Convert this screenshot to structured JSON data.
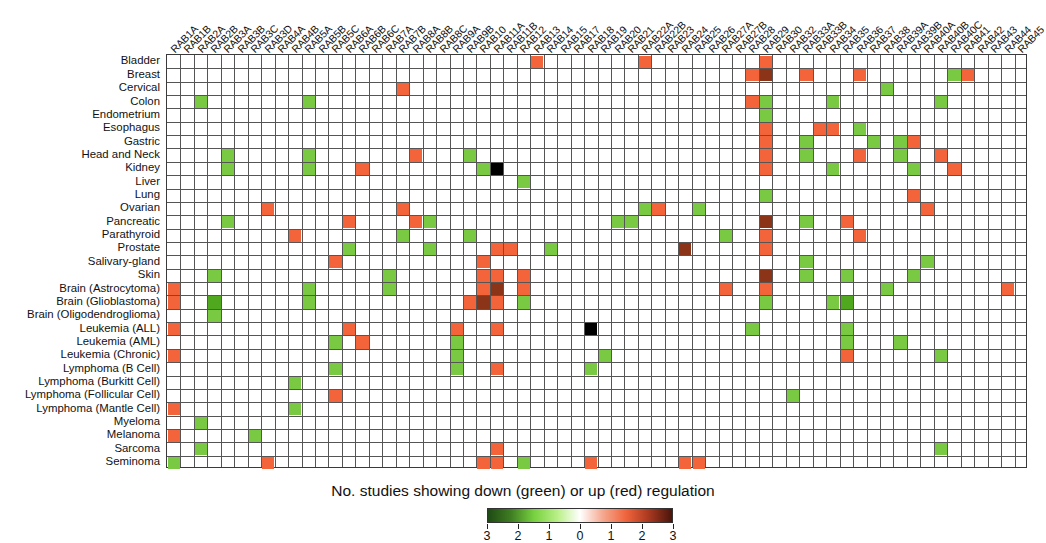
{
  "figure": {
    "caption": "No. studies showing down (green) or up (red) regulation",
    "grid": {
      "left": 166,
      "top": 54,
      "width": 861,
      "height": 414
    }
  },
  "colorbar": {
    "ticks": [
      "3",
      "2",
      "1",
      "0",
      "1",
      "2",
      "3"
    ],
    "stops": [
      "#1f4a14",
      "#3f7d22",
      "#77d13f",
      "#b8ef86",
      "#ffffff",
      "#f5a78e",
      "#f0643c",
      "#a8381f",
      "#4a150c"
    ],
    "left": 487,
    "width": 186
  },
  "colors": {
    "down1": "#7ac943",
    "down2": "#4fa81e",
    "down3": "#2d7a10",
    "up1": "#f4643a",
    "up2": "#8c3418",
    "up3": "#000000",
    "blank": "#ffffff",
    "gridline": "#555555"
  },
  "columns": [
    "RAB1A",
    "RAB1B",
    "RAB2A",
    "RAB2B",
    "RAB3A",
    "RAB3B",
    "RAB3C",
    "RAB3D",
    "RAB4A",
    "RAB4B",
    "RAB5A",
    "RAB5B",
    "RAB5C",
    "RAB6A",
    "RAB6B",
    "RAB6C",
    "RAB7A",
    "RAB7B",
    "RAB8A",
    "RAB8B",
    "RAB8C",
    "RAB9A",
    "RAB9B",
    "RAB10",
    "RAB11A",
    "RAB11B",
    "RAB12",
    "RAB13",
    "RAB14",
    "RAB15",
    "RAB17",
    "RAB18",
    "RAB19",
    "RAB20",
    "RAB21",
    "RAB22A",
    "RAB22B",
    "RAB23",
    "RAB24",
    "RAB25",
    "RAB26",
    "RAB27A",
    "RAB27B",
    "RAB28",
    "RAB29",
    "RAB30",
    "RAB32",
    "RAB33A",
    "RAB33B",
    "RAB34",
    "RAB35",
    "RAB36",
    "RAB37",
    "RAB38",
    "RAB39A",
    "RAB39B",
    "RAB40A",
    "RAB40B",
    "RAB40C",
    "RAB41",
    "RAB42",
    "RAB43",
    "RAB44",
    "RAB45"
  ],
  "rows": [
    "Bladder",
    "Breast",
    "Cervical",
    "Colon",
    "Endometrium",
    "Esophagus",
    "Gastric",
    "Head and Neck",
    "Kidney",
    "Liver",
    "Lung",
    "Ovarian",
    "Pancreatic",
    "Parathyroid",
    "Prostate",
    "Salivary-gland",
    "Skin",
    "Brain (Astrocytoma)",
    "Brain (Glioblastoma)",
    "Brain (Oligodendroglioma)",
    "Leukemia (ALL)",
    "Leukemia (AML)",
    "Leukemia (Chronic)",
    "Lymphoma (B Cell)",
    "Lymphoma (Burkitt Cell)",
    "Lymphoma (Follicular Cell)",
    "Lymphoma (Mantle Cell)",
    "Myeloma",
    "Melanoma",
    "Sarcoma",
    "Seminoma"
  ],
  "chart_data": {
    "type": "heatmap",
    "title": "",
    "xlabel": "",
    "ylabel": "",
    "caption": "No. studies showing down (green) or up (red) regulation",
    "legend_position": "bottom",
    "grid": true,
    "value_scale": {
      "min": -3,
      "max": 3,
      "negative_meaning": "down regulation (green)",
      "positive_meaning": "up regulation (red)",
      "tick_labels": [
        "3",
        "2",
        "1",
        "0",
        "1",
        "2",
        "3"
      ],
      "tick_values": [
        -3,
        -2,
        -1,
        0,
        1,
        2,
        3
      ]
    },
    "note": "cells listed as [row_index, col_index, value]; value sign: negative = down (green), positive = up (red); unlisted cells are 0",
    "cells": [
      [
        0,
        27,
        1
      ],
      [
        0,
        35,
        1
      ],
      [
        0,
        44,
        1
      ],
      [
        1,
        43,
        1
      ],
      [
        1,
        44,
        2
      ],
      [
        1,
        47,
        1
      ],
      [
        1,
        51,
        1
      ],
      [
        1,
        58,
        -1
      ],
      [
        1,
        59,
        1
      ],
      [
        2,
        17,
        1
      ],
      [
        2,
        53,
        -1
      ],
      [
        3,
        2,
        -1
      ],
      [
        3,
        10,
        -1
      ],
      [
        3,
        43,
        1
      ],
      [
        3,
        44,
        -1
      ],
      [
        3,
        49,
        -1
      ],
      [
        3,
        57,
        -1
      ],
      [
        4,
        44,
        -1
      ],
      [
        5,
        44,
        1
      ],
      [
        5,
        48,
        1
      ],
      [
        5,
        49,
        1
      ],
      [
        5,
        51,
        -1
      ],
      [
        6,
        44,
        1
      ],
      [
        6,
        47,
        -1
      ],
      [
        6,
        52,
        -1
      ],
      [
        6,
        54,
        -1
      ],
      [
        6,
        55,
        1
      ],
      [
        7,
        4,
        -1
      ],
      [
        7,
        10,
        -1
      ],
      [
        7,
        18,
        1
      ],
      [
        7,
        22,
        -1
      ],
      [
        7,
        44,
        1
      ],
      [
        7,
        47,
        -1
      ],
      [
        7,
        51,
        1
      ],
      [
        7,
        54,
        -1
      ],
      [
        7,
        57,
        1
      ],
      [
        8,
        4,
        -1
      ],
      [
        8,
        10,
        -1
      ],
      [
        8,
        14,
        1
      ],
      [
        8,
        23,
        -1
      ],
      [
        8,
        44,
        1
      ],
      [
        8,
        24,
        3
      ],
      [
        8,
        49,
        -1
      ],
      [
        8,
        55,
        -1
      ],
      [
        8,
        58,
        1
      ],
      [
        9,
        26,
        -1
      ],
      [
        10,
        55,
        1
      ],
      [
        10,
        44,
        -1
      ],
      [
        11,
        7,
        1
      ],
      [
        11,
        17,
        1
      ],
      [
        11,
        35,
        -1
      ],
      [
        11,
        36,
        1
      ],
      [
        11,
        39,
        -1
      ],
      [
        11,
        56,
        1
      ],
      [
        12,
        4,
        -1
      ],
      [
        12,
        13,
        1
      ],
      [
        12,
        18,
        1
      ],
      [
        12,
        19,
        -1
      ],
      [
        12,
        33,
        -1
      ],
      [
        12,
        34,
        -1
      ],
      [
        12,
        44,
        2
      ],
      [
        12,
        47,
        -1
      ],
      [
        12,
        50,
        1
      ],
      [
        13,
        9,
        1
      ],
      [
        13,
        17,
        -1
      ],
      [
        13,
        22,
        -1
      ],
      [
        13,
        41,
        -1
      ],
      [
        13,
        44,
        1
      ],
      [
        13,
        51,
        1
      ],
      [
        14,
        13,
        -1
      ],
      [
        14,
        19,
        -1
      ],
      [
        14,
        24,
        1
      ],
      [
        14,
        25,
        1
      ],
      [
        14,
        28,
        -1
      ],
      [
        14,
        38,
        2
      ],
      [
        14,
        44,
        1
      ],
      [
        15,
        12,
        1
      ],
      [
        15,
        23,
        1
      ],
      [
        15,
        47,
        -1
      ],
      [
        15,
        56,
        -1
      ],
      [
        16,
        3,
        -1
      ],
      [
        16,
        16,
        -1
      ],
      [
        16,
        23,
        1
      ],
      [
        16,
        24,
        1
      ],
      [
        16,
        26,
        1
      ],
      [
        16,
        44,
        2
      ],
      [
        16,
        47,
        -1
      ],
      [
        16,
        50,
        -1
      ],
      [
        16,
        55,
        -1
      ],
      [
        17,
        0,
        1
      ],
      [
        17,
        10,
        -1
      ],
      [
        17,
        16,
        -1
      ],
      [
        17,
        23,
        1
      ],
      [
        17,
        24,
        2
      ],
      [
        17,
        26,
        1
      ],
      [
        17,
        41,
        1
      ],
      [
        17,
        44,
        1
      ],
      [
        17,
        53,
        -1
      ],
      [
        17,
        62,
        1
      ],
      [
        18,
        0,
        1
      ],
      [
        18,
        3,
        -2
      ],
      [
        18,
        10,
        -1
      ],
      [
        18,
        22,
        1
      ],
      [
        18,
        23,
        2
      ],
      [
        18,
        24,
        1
      ],
      [
        18,
        26,
        -1
      ],
      [
        18,
        44,
        -1
      ],
      [
        18,
        49,
        -1
      ],
      [
        18,
        50,
        -2
      ],
      [
        19,
        3,
        -1
      ],
      [
        20,
        0,
        1
      ],
      [
        20,
        13,
        1
      ],
      [
        20,
        21,
        1
      ],
      [
        20,
        24,
        1
      ],
      [
        20,
        31,
        3
      ],
      [
        20,
        43,
        -1
      ],
      [
        20,
        50,
        -1
      ],
      [
        21,
        12,
        -1
      ],
      [
        21,
        14,
        1
      ],
      [
        21,
        21,
        -1
      ],
      [
        21,
        50,
        -1
      ],
      [
        21,
        54,
        -1
      ],
      [
        22,
        0,
        1
      ],
      [
        22,
        21,
        -1
      ],
      [
        22,
        32,
        -1
      ],
      [
        22,
        50,
        1
      ],
      [
        22,
        57,
        -1
      ],
      [
        23,
        12,
        -1
      ],
      [
        23,
        21,
        -1
      ],
      [
        23,
        24,
        1
      ],
      [
        23,
        31,
        -1
      ],
      [
        24,
        9,
        -1
      ],
      [
        25,
        12,
        1
      ],
      [
        25,
        46,
        -1
      ],
      [
        26,
        0,
        1
      ],
      [
        26,
        9,
        -1
      ],
      [
        27,
        2,
        -1
      ],
      [
        28,
        0,
        1
      ],
      [
        28,
        6,
        -1
      ],
      [
        29,
        2,
        -1
      ],
      [
        29,
        24,
        1
      ],
      [
        29,
        57,
        -1
      ],
      [
        30,
        0,
        -1
      ],
      [
        30,
        7,
        1
      ],
      [
        30,
        23,
        1
      ],
      [
        30,
        24,
        1
      ],
      [
        30,
        26,
        -1
      ],
      [
        30,
        31,
        1
      ],
      [
        30,
        38,
        1
      ],
      [
        30,
        39,
        1
      ]
    ]
  }
}
